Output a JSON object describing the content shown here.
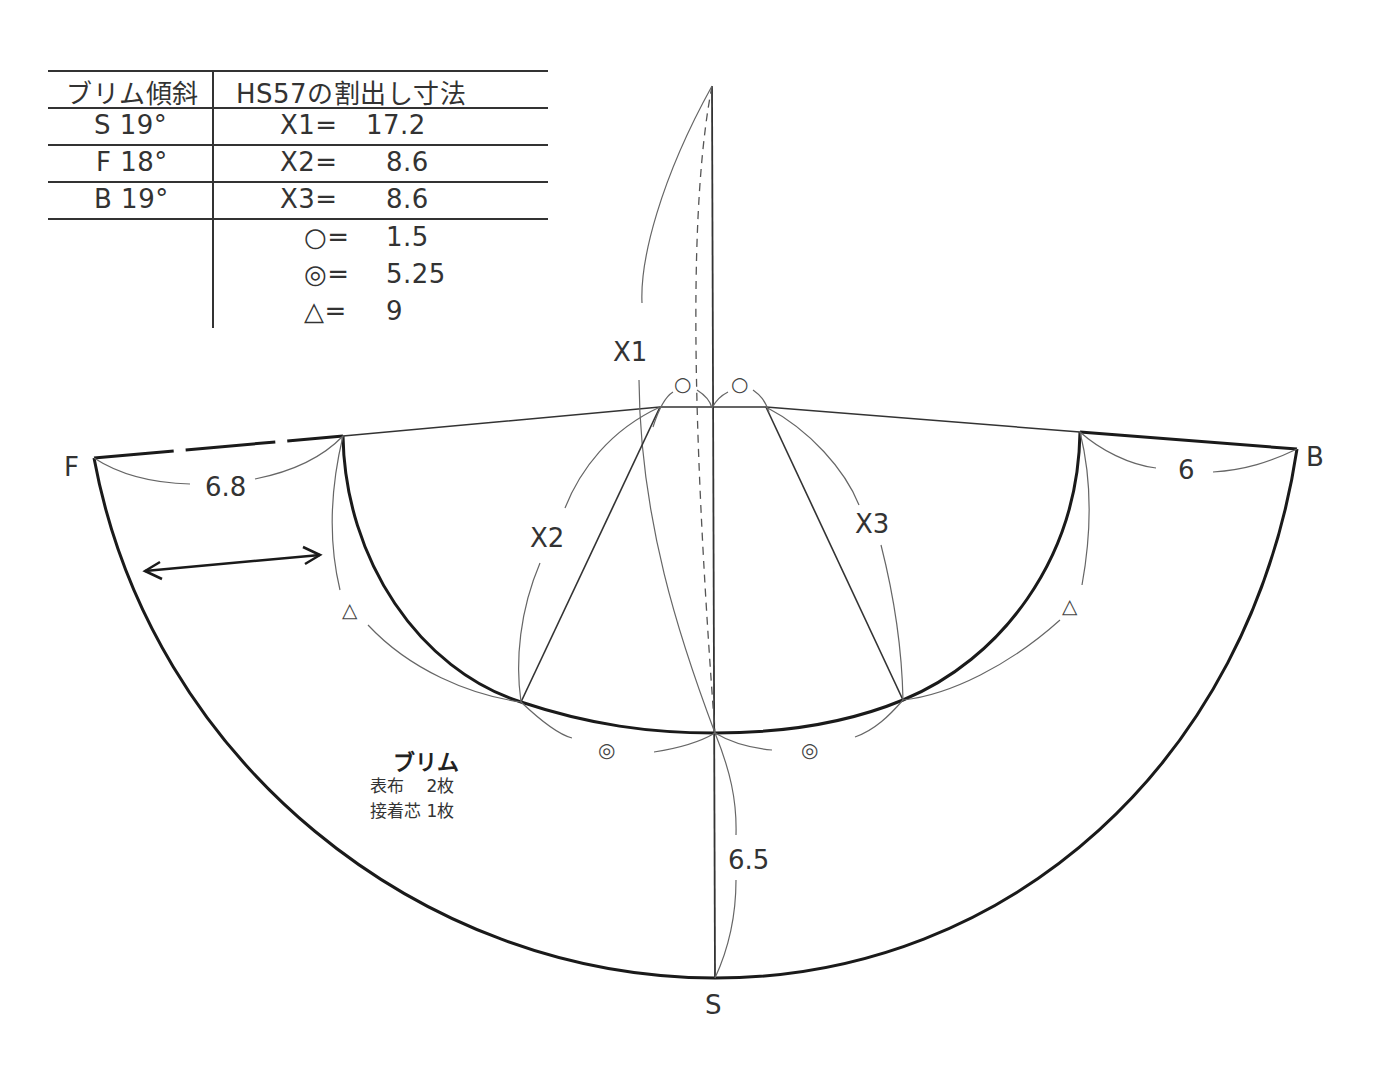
{
  "table": {
    "headers": [
      "ブリム傾斜",
      "HS57の割出し寸法"
    ],
    "brim_slopes": [
      "S 19°",
      "F 18°",
      "B 19°"
    ],
    "dimensions": [
      {
        "label": "X1=",
        "value": "17.2"
      },
      {
        "label": "X2=",
        "value": "8.6"
      },
      {
        "label": "X3=",
        "value": "8.6"
      },
      {
        "label": "○=",
        "value": "1.5"
      },
      {
        "label": "◎=",
        "value": "5.25"
      },
      {
        "label": "△=",
        "value": "9"
      }
    ]
  },
  "diagram": {
    "points": {
      "front": "F",
      "back": "B",
      "side": "S"
    },
    "measure_labels": {
      "x1": "X1",
      "x2": "X2",
      "x3": "X3",
      "front_width": "6.8",
      "back_width": "6",
      "side_width": "6.5"
    },
    "symbols": {
      "circle": "○",
      "double_circle": "◎",
      "triangle": "△"
    },
    "piece": {
      "title": "ブリム",
      "lines": [
        "表布　 2枚",
        "接着芯 1枚"
      ]
    }
  },
  "colors": {
    "line": "#222222",
    "thin_line": "#555555",
    "text": "#333333",
    "background": "#ffffff"
  }
}
